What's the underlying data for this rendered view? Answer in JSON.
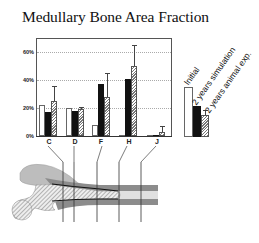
{
  "chart_data": {
    "type": "bar",
    "title": "Medullary Bone Area Fraction",
    "xlabel": "",
    "ylabel": "",
    "categories": [
      "C",
      "D",
      "F",
      "H",
      "J"
    ],
    "series": [
      {
        "name": "Initial",
        "style": "white",
        "values": [
          22,
          20,
          8,
          1,
          1
        ]
      },
      {
        "name": "2 years simulation",
        "style": "black",
        "values": [
          17,
          18,
          37,
          41,
          1
        ]
      },
      {
        "name": "2 years animal exp.",
        "style": "hatched",
        "values": [
          25,
          19,
          28,
          50,
          3
        ],
        "error_upper": [
          36,
          21,
          45,
          65,
          7
        ]
      }
    ],
    "yticks": [
      "0%",
      "20%",
      "40%",
      "60%"
    ],
    "ylim": [
      0,
      68
    ],
    "grid": true,
    "legend_position": "right"
  },
  "title": "Medullary Bone Area Fraction",
  "yaxis": {
    "ticks": [
      {
        "label": "60%",
        "value": 60
      },
      {
        "label": "40%",
        "value": 40
      },
      {
        "label": "20%",
        "value": 20
      },
      {
        "label": "0%",
        "value": 0
      }
    ]
  },
  "xaxis": {
    "labels": [
      "C",
      "D",
      "F",
      "H",
      "J"
    ]
  },
  "legend": {
    "items": [
      "Initial",
      "2 years simulation",
      "2 years animal exp."
    ]
  },
  "colors": {
    "initial": "#ffffff",
    "simulation": "#111111",
    "animal": "#888888",
    "bone_cortex": "#8a8a8a",
    "trabecular": "#cfcfcf"
  }
}
